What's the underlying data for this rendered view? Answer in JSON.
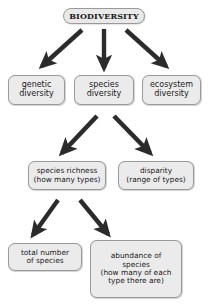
{
  "diagram": {
    "type": "flow-diagram",
    "canvas": {
      "width": 208,
      "height": 304,
      "background": "#ffffff"
    },
    "style": {
      "node_fill": "#ebebeb",
      "node_border": "#9a9a9a",
      "arrow_color": "#2b2b2b",
      "text_color": "#1a1a1a"
    },
    "nodes": {
      "root": {
        "lines": [
          "BIODIVERSITY"
        ]
      },
      "genetic": {
        "lines": [
          "genetic",
          "diversity"
        ]
      },
      "species": {
        "lines": [
          "species",
          "diversity"
        ]
      },
      "ecosystem": {
        "lines": [
          "ecosystem",
          "diversity"
        ]
      },
      "richness": {
        "lines": [
          "species richness",
          "(how many types)"
        ]
      },
      "disparity": {
        "lines": [
          "disparity",
          "(range of types)"
        ]
      },
      "total": {
        "lines": [
          "total number",
          "of species"
        ]
      },
      "abundance": {
        "lines": [
          "abundance of",
          "species",
          "(how many of each",
          "type there are)"
        ]
      }
    },
    "edges": [
      {
        "from": "root",
        "to": "genetic",
        "direction": "down-left"
      },
      {
        "from": "root",
        "to": "species",
        "direction": "down"
      },
      {
        "from": "root",
        "to": "ecosystem",
        "direction": "down-right"
      },
      {
        "from": "species",
        "to": "richness",
        "direction": "down-left"
      },
      {
        "from": "species",
        "to": "disparity",
        "direction": "down-right"
      },
      {
        "from": "richness",
        "to": "total",
        "direction": "down-left"
      },
      {
        "from": "richness",
        "to": "abundance",
        "direction": "down-right"
      }
    ]
  }
}
